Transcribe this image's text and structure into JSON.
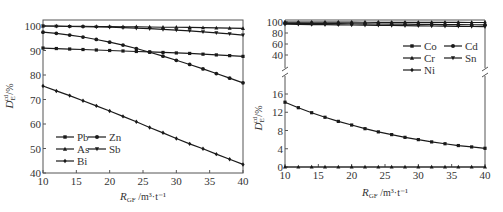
{
  "chart_data": [
    {
      "type": "line",
      "panel": "left",
      "title": "",
      "xlabel": "R_GF /m³·t⁻¹",
      "ylabel": "D_E^cd /%",
      "xlim": [
        10,
        40
      ],
      "ylim": [
        40,
        100
      ],
      "xticks": [
        10,
        15,
        20,
        25,
        30,
        35,
        40
      ],
      "yticks": [
        40,
        50,
        60,
        70,
        80,
        90,
        100
      ],
      "grid": false,
      "legend_position": "lower-left",
      "x": [
        10,
        12,
        14,
        16,
        18,
        20,
        22,
        24,
        26,
        28,
        30,
        32,
        34,
        36,
        38,
        40
      ],
      "series": [
        {
          "name": "Pb",
          "marker": "square",
          "values": [
            91.0,
            90.8,
            90.6,
            90.4,
            90.2,
            90.0,
            89.8,
            89.6,
            89.4,
            89.2,
            89.0,
            88.8,
            88.5,
            88.2,
            87.9,
            87.6
          ]
        },
        {
          "name": "As",
          "marker": "triangle",
          "values": [
            100.0,
            100.0,
            99.9,
            99.9,
            99.8,
            99.8,
            99.7,
            99.7,
            99.6,
            99.5,
            99.5,
            99.4,
            99.3,
            99.2,
            99.1,
            99.0
          ]
        },
        {
          "name": "Bi",
          "marker": "diamond",
          "values": [
            75.5,
            73.5,
            71.6,
            69.5,
            67.4,
            65.3,
            63.1,
            60.9,
            58.6,
            56.4,
            54.1,
            51.9,
            49.9,
            47.7,
            45.6,
            43.5
          ]
        },
        {
          "name": "Zn",
          "marker": "circle",
          "values": [
            97.5,
            97.0,
            96.3,
            95.5,
            94.5,
            93.4,
            92.2,
            90.8,
            89.3,
            87.7,
            86.0,
            84.3,
            82.5,
            80.6,
            78.7,
            76.8
          ]
        },
        {
          "name": "Sb",
          "marker": "down-triangle",
          "values": [
            100.0,
            99.9,
            99.8,
            99.7,
            99.6,
            99.5,
            99.3,
            99.1,
            98.9,
            98.6,
            98.3,
            98.0,
            97.6,
            97.2,
            96.8,
            96.3
          ]
        }
      ]
    },
    {
      "type": "line",
      "panel": "right",
      "title": "",
      "xlabel": "R_GF /m³·t⁻¹",
      "ylabel": "D_E^cd /%",
      "xlim": [
        10,
        40
      ],
      "ylim": [
        0,
        100
      ],
      "axis_break": {
        "lower": [
          0,
          18
        ],
        "upper": [
          30,
          100
        ]
      },
      "xticks": [
        10,
        15,
        20,
        25,
        30,
        35,
        40
      ],
      "yticks_lower": [
        0,
        4,
        8,
        12,
        16
      ],
      "yticks_upper": [
        40,
        60,
        80,
        100
      ],
      "grid": false,
      "legend_position": "upper-right",
      "x": [
        10,
        12,
        14,
        16,
        18,
        20,
        22,
        24,
        26,
        28,
        30,
        32,
        34,
        36,
        38,
        40
      ],
      "series": [
        {
          "name": "Co",
          "marker": "square",
          "values": [
            14.2,
            13.0,
            11.9,
            10.9,
            10.0,
            9.2,
            8.4,
            7.7,
            7.1,
            6.5,
            6.0,
            5.5,
            5.1,
            4.7,
            4.4,
            4.1
          ]
        },
        {
          "name": "Cr",
          "marker": "triangle",
          "values": [
            0,
            0,
            0,
            0,
            0,
            0,
            0,
            0,
            0,
            0,
            0,
            0,
            0,
            0,
            0,
            0
          ]
        },
        {
          "name": "Ni",
          "marker": "diamond",
          "values": [
            99.8,
            99.8,
            99.7,
            99.7,
            99.6,
            99.6,
            99.5,
            99.5,
            99.4,
            99.4,
            99.3,
            99.3,
            99.2,
            99.2,
            99.1,
            99.1
          ]
        },
        {
          "name": "Cd",
          "marker": "circle",
          "values": [
            97.5,
            97.4,
            97.3,
            97.1,
            97.0,
            96.8,
            96.6,
            96.4,
            96.2,
            96.0,
            95.8,
            95.6,
            95.4,
            95.2,
            95.0,
            94.8
          ]
        },
        {
          "name": "Sn",
          "marker": "down-triangle",
          "values": [
            96.0,
            95.7,
            95.4,
            95.1,
            94.8,
            94.5,
            94.2,
            93.9,
            93.6,
            93.3,
            93.0,
            92.7,
            92.4,
            92.1,
            91.8,
            91.5
          ]
        }
      ]
    }
  ],
  "labels": {
    "left": {
      "ylabel_main": "D",
      "ylabel_sub": "E",
      "ylabel_sup": "cd",
      "ylabel_unit": "/%",
      "xlabel_main": "R",
      "xlabel_sub": "GF",
      "xlabel_unit": "/m³·t⁻¹",
      "legend": [
        "Pb",
        "Zn",
        "As",
        "Sb",
        "Bi"
      ]
    },
    "right": {
      "ylabel_main": "D",
      "ylabel_sub": "E",
      "ylabel_sup": "cd",
      "ylabel_unit": "/%",
      "xlabel_main": "R",
      "xlabel_sub": "GF",
      "xlabel_unit": "/m³·t⁻¹",
      "legend": [
        "Co",
        "Cd",
        "Cr",
        "Sn",
        "Ni"
      ]
    }
  },
  "colors": {
    "line": "#1a1a1a",
    "axis": "#555555",
    "text": "#333333"
  }
}
